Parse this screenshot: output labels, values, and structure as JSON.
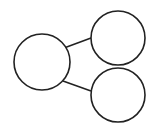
{
  "diagram": {
    "type": "tree",
    "stroke_color": "#222222",
    "background": "#ffffff",
    "nodes": [
      {
        "id": "root",
        "label": "",
        "cx": 42,
        "cy": 62,
        "r": 28
      },
      {
        "id": "child-top",
        "label": "",
        "cx": 118,
        "cy": 38,
        "r": 27
      },
      {
        "id": "child-bottom",
        "label": "",
        "cx": 118,
        "cy": 95,
        "r": 27
      }
    ],
    "edges": [
      {
        "from": "root",
        "to": "child-top"
      },
      {
        "from": "root",
        "to": "child-bottom"
      }
    ]
  }
}
